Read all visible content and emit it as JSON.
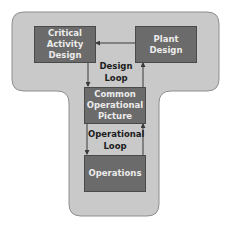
{
  "diagram": {
    "nodes": {
      "critical_activity_design": "Critical Activity Design",
      "plant_design": "Plant Design",
      "common_operational_picture": "Common Operational Picture",
      "operations": "Operations"
    },
    "loops": {
      "design_loop": "Design Loop",
      "operational_loop": "Operational Loop"
    },
    "edges": [
      {
        "from": "Plant Design",
        "to": "Critical Activity Design"
      },
      {
        "from": "Critical Activity Design",
        "to": "Common Operational Picture"
      },
      {
        "from": "Common Operational Picture",
        "to": "Plant Design"
      },
      {
        "from": "Common Operational Picture",
        "to": "Operations"
      },
      {
        "from": "Operations",
        "to": "Common Operational Picture"
      }
    ],
    "colors": {
      "background_shape": "#c9c9c9",
      "box_fill": "#6b6b6b",
      "box_text": "#ececec",
      "label_text": "#1c1c1c"
    }
  }
}
